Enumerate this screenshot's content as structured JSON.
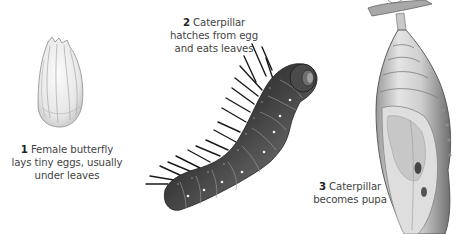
{
  "diagram": {
    "stages": [
      {
        "number": "1",
        "text": "Female butterfly",
        "line2": "lays tiny eggs, usually",
        "line3": "under leaves",
        "illustration": "egg-illustration"
      },
      {
        "number": "2",
        "text": "Caterpillar",
        "line2": "hatches from egg",
        "line3": "and eats leaves",
        "illustration": "caterpillar-illustration"
      },
      {
        "number": "3",
        "text": "Caterpillar",
        "line2": "becomes pupa",
        "illustration": "pupa-illustration"
      }
    ]
  },
  "colors": {
    "background": "#ffffff",
    "caption_text": "#444444",
    "egg": "#e8e8e8",
    "caterpillar_body": "#5a5a5a",
    "caterpillar_dark": "#1e1e1e",
    "pupa": "#d4d4d4"
  }
}
